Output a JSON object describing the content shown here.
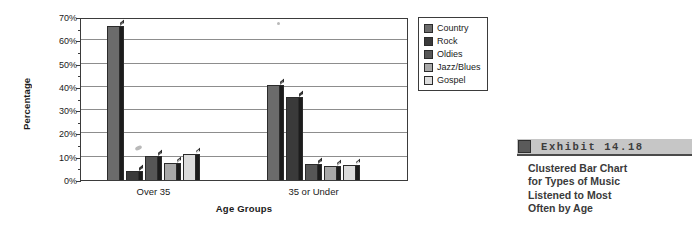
{
  "chart_data": {
    "type": "bar",
    "title": "",
    "xlabel": "Age Groups",
    "ylabel": "Percentage",
    "categories": [
      "Over 35",
      "35 or Under"
    ],
    "series": [
      {
        "name": "Country",
        "color": "#6b6b6b",
        "values": [
          66,
          41
        ]
      },
      {
        "name": "Rock",
        "color": "#3a3a3a",
        "values": [
          4,
          35.5
        ]
      },
      {
        "name": "Oldies",
        "color": "#565656",
        "values": [
          10.5,
          7
        ]
      },
      {
        "name": "Jazz/Blues",
        "color": "#a8a8a8",
        "values": [
          7.5,
          6
        ]
      },
      {
        "name": "Gospel",
        "color": "#dcdcdc",
        "values": [
          11,
          6.5
        ]
      }
    ],
    "ylim": [
      0,
      70
    ],
    "yticks": [
      0,
      10,
      20,
      30,
      40,
      50,
      60,
      70
    ],
    "ytick_labels": [
      "0%",
      "10%",
      "20%",
      "30%",
      "40%",
      "50%",
      "60%",
      "70%"
    ],
    "ytick_minor_step": 5,
    "grid": true,
    "legend_position": "right",
    "legend_entries": [
      "Country",
      "Rock",
      "Oldies",
      "Jazz/Blues",
      "Gospel"
    ]
  },
  "exhibit": {
    "label": "Exhibit   14.18",
    "caption_lines": [
      "Clustered Bar Chart",
      "for Types of Music",
      "Listened to Most",
      "Often by Age"
    ],
    "marker_icon": "exhibit-square-icon"
  }
}
